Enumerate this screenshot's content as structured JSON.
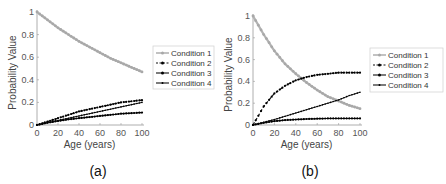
{
  "chart_data": [
    {
      "type": "line",
      "panel_label": "(a)",
      "xlabel": "Age (years)",
      "ylabel": "Probability Value",
      "xlim": [
        0,
        100
      ],
      "ylim": [
        0,
        1
      ],
      "xticks": [
        "0",
        "20",
        "40",
        "60",
        "80",
        "100"
      ],
      "yticks": [
        "0",
        "0.2",
        "0.4",
        "0.6",
        "0.8",
        "1"
      ],
      "grid": false,
      "legend_position": "right",
      "x": [
        0,
        10,
        20,
        30,
        40,
        50,
        60,
        70,
        80,
        90,
        100
      ],
      "series": [
        {
          "name": "Condition 1",
          "values": [
            1.0,
            0.93,
            0.86,
            0.8,
            0.74,
            0.69,
            0.64,
            0.59,
            0.55,
            0.51,
            0.47
          ]
        },
        {
          "name": "Condition 2",
          "values": [
            0.0,
            0.03,
            0.06,
            0.09,
            0.12,
            0.14,
            0.16,
            0.18,
            0.2,
            0.21,
            0.22
          ]
        },
        {
          "name": "Condition 3",
          "values": [
            0.0,
            0.02,
            0.035,
            0.05,
            0.06,
            0.07,
            0.08,
            0.09,
            0.1,
            0.105,
            0.11
          ]
        },
        {
          "name": "Condition 4",
          "values": [
            0.0,
            0.02,
            0.04,
            0.06,
            0.08,
            0.1,
            0.12,
            0.14,
            0.16,
            0.18,
            0.2
          ]
        }
      ]
    },
    {
      "type": "line",
      "panel_label": "(b)",
      "xlabel": "Age (years)",
      "ylabel": "Probability Value",
      "xlim": [
        0,
        100
      ],
      "ylim": [
        0,
        1
      ],
      "xticks": [
        "0",
        "20",
        "40",
        "60",
        "80",
        "100"
      ],
      "yticks": [
        "0",
        "0.2",
        "0.4",
        "0.6",
        "0.8",
        "1"
      ],
      "grid": false,
      "legend_position": "right",
      "x": [
        0,
        10,
        20,
        30,
        40,
        50,
        60,
        70,
        80,
        90,
        100
      ],
      "series": [
        {
          "name": "Condition 1",
          "values": [
            1.0,
            0.83,
            0.68,
            0.56,
            0.47,
            0.39,
            0.32,
            0.26,
            0.22,
            0.18,
            0.15
          ]
        },
        {
          "name": "Condition 2",
          "values": [
            0.0,
            0.17,
            0.29,
            0.36,
            0.41,
            0.44,
            0.46,
            0.47,
            0.48,
            0.48,
            0.48
          ]
        },
        {
          "name": "Condition 3",
          "values": [
            0.0,
            0.02,
            0.035,
            0.045,
            0.05,
            0.055,
            0.058,
            0.06,
            0.06,
            0.06,
            0.06
          ]
        },
        {
          "name": "Condition 4",
          "values": [
            0.0,
            0.025,
            0.05,
            0.08,
            0.11,
            0.14,
            0.17,
            0.2,
            0.23,
            0.27,
            0.3
          ]
        }
      ]
    }
  ],
  "colors": {
    "condition1": "#b3b3b3",
    "condition2": "#111111",
    "condition3": "#111111",
    "condition4": "#111111",
    "axis": "#999999"
  }
}
